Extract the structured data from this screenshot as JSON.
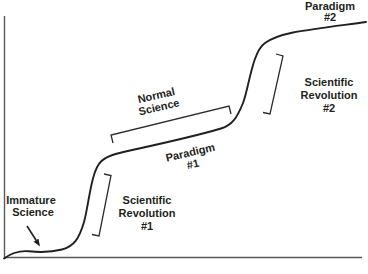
{
  "diagram": {
    "type": "kuhn-scientific-revolutions-cycle",
    "colors": {
      "curve": "#231f20",
      "axis": "#58595b",
      "text": "#231f20",
      "background": "#ffffff"
    },
    "labels": {
      "paradigm_2": {
        "lines": [
          "Paradigm",
          "#2"
        ]
      },
      "scientific_revolution_2": {
        "lines": [
          "Scientific",
          "Revolution",
          "#2"
        ]
      },
      "normal_science": {
        "lines": [
          "Normal",
          "Science"
        ]
      },
      "paradigm_1": {
        "lines": [
          "Paradigm",
          "#1"
        ]
      },
      "scientific_revolution_1": {
        "lines": [
          "Scientific",
          "Revolution",
          "#1"
        ]
      },
      "immature_science": {
        "lines": [
          "Immature",
          "Science"
        ]
      }
    }
  }
}
